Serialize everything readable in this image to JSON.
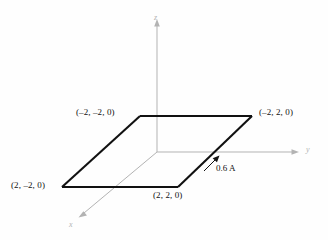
{
  "figure": {
    "background_color": "#fefefe",
    "loop_color": "#111111",
    "axis_color": "#b3b3b3",
    "label_color": "#111111"
  },
  "axes": {
    "x": {
      "label": "x",
      "direction": "down-left",
      "arrow": true
    },
    "y": {
      "label": "y",
      "direction": "right",
      "arrow": true
    },
    "z": {
      "label": "z",
      "direction": "up",
      "arrow": true
    }
  },
  "loop": {
    "shape": "parallelogram",
    "vertices": [
      {
        "name": "top-left",
        "label": "(–2, –2, 0)",
        "coords": [
          -2,
          -2,
          0
        ]
      },
      {
        "name": "top-right",
        "label": "(–2, 2, 0)",
        "coords": [
          -2,
          2,
          0
        ]
      },
      {
        "name": "bottom-right",
        "label": "(2, 2, 0)",
        "coords": [
          2,
          2,
          0
        ]
      },
      {
        "name": "bottom-left",
        "label": "(2, –2, 0)",
        "coords": [
          2,
          -2,
          0
        ]
      }
    ]
  },
  "current": {
    "label": "0.6 A",
    "value": 0.6,
    "unit": "A",
    "arrow_direction": "up-right-along-right-edge"
  }
}
